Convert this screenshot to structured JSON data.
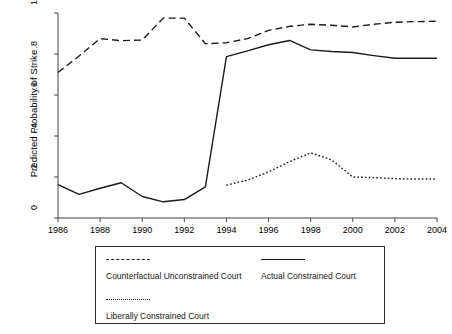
{
  "chart_data": {
    "type": "line",
    "title": "",
    "xlabel": "",
    "ylabel": "Predicted Probability of Strike",
    "xlim": [
      1986,
      2004
    ],
    "ylim": [
      0,
      1
    ],
    "grid": false,
    "legend_position": "below-axes",
    "x": [
      1986,
      1987,
      1988,
      1989,
      1990,
      1991,
      1992,
      1993,
      1994,
      1995,
      1996,
      1997,
      1998,
      1999,
      2000,
      2001,
      2002,
      2003,
      2004
    ],
    "xticks": [
      1986,
      1988,
      1990,
      1992,
      1994,
      1996,
      1998,
      2000,
      2002,
      2004
    ],
    "xtick_labels": [
      "1986",
      "1988",
      "1990",
      "1992",
      "1994",
      "1996",
      "1998",
      "2000",
      "2002",
      "2004"
    ],
    "yticks": [
      0,
      0.2,
      0.4,
      0.6,
      0.8,
      1
    ],
    "ytick_labels": [
      "0",
      ".2",
      ".4",
      ".6",
      ".8",
      "1"
    ],
    "series": [
      {
        "name": "Counterfactual Unconstrained Court",
        "style": "dashed",
        "color": "#1a1a1a",
        "x": [
          1986,
          1987,
          1988,
          1989,
          1990,
          1991,
          1992,
          1993,
          1994,
          1995,
          1996,
          1997,
          1998,
          1999,
          2000,
          2001,
          2002,
          2003,
          2004
        ],
        "values": [
          0.71,
          0.79,
          0.875,
          0.865,
          0.868,
          0.975,
          0.975,
          0.85,
          0.855,
          0.875,
          0.915,
          0.935,
          0.945,
          0.94,
          0.932,
          0.945,
          0.955,
          0.958,
          0.96
        ]
      },
      {
        "name": "Actual Constrained Court",
        "style": "solid",
        "color": "#1a1a1a",
        "x": [
          1986,
          1987,
          1988,
          1989,
          1990,
          1991,
          1992,
          1993,
          1994,
          1995,
          1996,
          1997,
          1998,
          1999,
          2000,
          2001,
          2002,
          2003,
          2004
        ],
        "values": [
          0.163,
          0.115,
          0.145,
          0.172,
          0.105,
          0.079,
          0.09,
          0.152,
          0.787,
          0.815,
          0.845,
          0.866,
          0.82,
          0.812,
          0.807,
          0.792,
          0.779,
          0.779,
          0.779
        ]
      },
      {
        "name": "Liberally Constrained Court",
        "style": "dotted",
        "color": "#1a1a1a",
        "x": [
          1994,
          1995,
          1996,
          1997,
          1998,
          1999,
          2000,
          2001,
          2002,
          2003,
          2004
        ],
        "values": [
          0.16,
          0.185,
          0.225,
          0.275,
          0.318,
          0.283,
          0.2,
          0.197,
          0.192,
          0.19,
          0.19
        ]
      }
    ]
  },
  "axes": {
    "y_title": "Predicted Probability of Strike"
  },
  "legend": {
    "entries": [
      {
        "label": "Counterfactual Unconstrained Court",
        "style": "dashed"
      },
      {
        "label": "Actual Constrained Court",
        "style": "solid"
      },
      {
        "label": "Liberally Constrained Court",
        "style": "dotted"
      }
    ]
  }
}
